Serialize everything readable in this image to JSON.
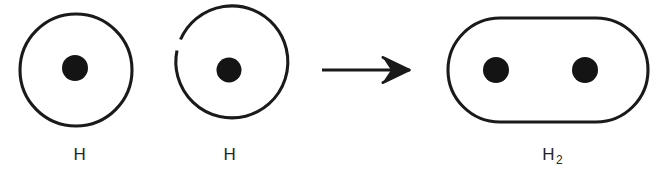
{
  "figure": {
    "kind": "chemical-reaction-schematic",
    "background_color": "#ffffff",
    "ink_color": "#1a1a1a"
  },
  "reactants": [
    {
      "id": "hydrogen-atom-1",
      "label": "H",
      "shell": {
        "shape": "circle",
        "cx": 76,
        "cy": 70,
        "r": 56,
        "stroke_width": 3.1,
        "gap": false
      },
      "nucleus": {
        "cx": 75,
        "cy": 68,
        "r": 13
      },
      "label_x": 80,
      "label_y": 146
    },
    {
      "id": "hydrogen-atom-2",
      "label": "H",
      "shell": {
        "shape": "circle",
        "cx": 229,
        "cy": 70,
        "r": 56,
        "stroke_width": 3.1,
        "gap": true
      },
      "nucleus": {
        "cx": 229,
        "cy": 70,
        "r": 12.5
      },
      "label_x": 230,
      "label_y": 146
    }
  ],
  "operator": {
    "id": "reaction-arrow",
    "symbol": "→",
    "direction": "right",
    "shaft_x_start": 322,
    "shaft_x_end": 402,
    "y": 70,
    "tip_x": 409,
    "stroke_width": 3.2
  },
  "products": [
    {
      "id": "hydrogen-molecule",
      "label": "H2",
      "label_base": "H",
      "label_sub": "2",
      "shell": {
        "shape": "stadium",
        "x": 448,
        "y": 18,
        "width": 200,
        "height": 104,
        "radius": 52,
        "stroke_width": 3.1
      },
      "nuclei": [
        {
          "cx": 496,
          "cy": 70,
          "r": 13
        },
        {
          "cx": 585,
          "cy": 70,
          "r": 13
        }
      ],
      "label_x": 552,
      "label_y": 146
    }
  ]
}
